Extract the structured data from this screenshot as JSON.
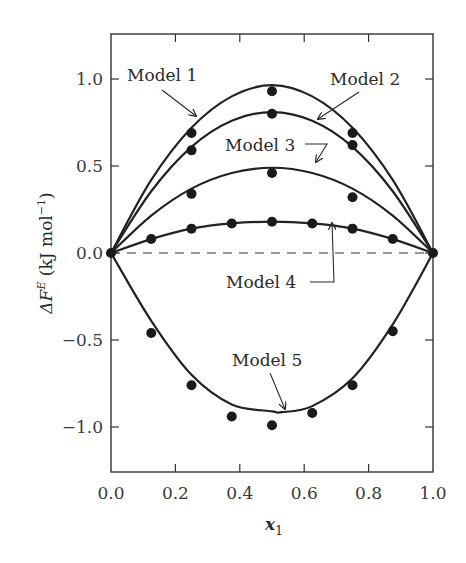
{
  "chart_data": {
    "type": "line",
    "title": "",
    "xlabel": "x1",
    "ylabel": "ΔF^E (kJ mol^-1)",
    "xlim": [
      0.0,
      1.0
    ],
    "ylim": [
      -1.26,
      1.26
    ],
    "grid": false,
    "legend": "inline annotations with arrows",
    "x_ticks": [
      "0.0",
      "0.2",
      "0.4",
      "0.6",
      "0.8",
      "1.0"
    ],
    "y_ticks": [
      "1.0",
      "0.5",
      "0.0",
      "-0.5",
      "-1.0"
    ],
    "reference_line": {
      "y": 0.0,
      "style": "dashed"
    },
    "series": [
      {
        "name": "Model 1",
        "curve_peak": 0.965,
        "curve_x": [
          0,
          0.125,
          0.25,
          0.375,
          0.5,
          0.625,
          0.75,
          0.875,
          1.0
        ],
        "curve_y": [
          0,
          0.42,
          0.72,
          0.9,
          0.965,
          0.9,
          0.72,
          0.42,
          0
        ],
        "points_x": [
          0.0,
          0.25,
          0.5,
          0.75,
          1.0
        ],
        "points_y": [
          0.0,
          0.69,
          0.93,
          0.69,
          0.0
        ]
      },
      {
        "name": "Model 2",
        "curve_peak": 0.81,
        "curve_x": [
          0,
          0.125,
          0.25,
          0.375,
          0.5,
          0.625,
          0.75,
          0.875,
          1.0
        ],
        "curve_y": [
          0,
          0.355,
          0.61,
          0.76,
          0.81,
          0.76,
          0.61,
          0.355,
          0
        ],
        "points_x": [
          0.25,
          0.5,
          0.75
        ],
        "points_y": [
          0.59,
          0.8,
          0.62
        ]
      },
      {
        "name": "Model 3",
        "curve_peak": 0.49,
        "curve_x": [
          0,
          0.125,
          0.25,
          0.375,
          0.5,
          0.625,
          0.75,
          0.875,
          1.0
        ],
        "curve_y": [
          0,
          0.215,
          0.37,
          0.46,
          0.49,
          0.46,
          0.37,
          0.215,
          0
        ],
        "points_x": [
          0.25,
          0.5,
          0.75
        ],
        "points_y": [
          0.34,
          0.46,
          0.32
        ]
      },
      {
        "name": "Model 4",
        "curve_peak": 0.18,
        "curve_x": [
          0,
          0.125,
          0.25,
          0.375,
          0.5,
          0.625,
          0.75,
          0.875,
          1.0
        ],
        "curve_y": [
          0,
          0.08,
          0.14,
          0.17,
          0.18,
          0.17,
          0.14,
          0.08,
          0
        ],
        "points_x": [
          0.125,
          0.25,
          0.375,
          0.5,
          0.625,
          0.75,
          0.875
        ],
        "points_y": [
          0.08,
          0.14,
          0.17,
          0.18,
          0.17,
          0.14,
          0.08
        ]
      },
      {
        "name": "Model 5",
        "curve_peak": -0.915,
        "curve_x": [
          0,
          0.125,
          0.25,
          0.375,
          0.5,
          0.53,
          0.625,
          0.75,
          0.875,
          1.0
        ],
        "curve_y": [
          0,
          -0.39,
          -0.7,
          -0.87,
          -0.91,
          -0.915,
          -0.88,
          -0.72,
          -0.41,
          0
        ],
        "points_x": [
          0.125,
          0.25,
          0.375,
          0.5,
          0.625,
          0.75,
          0.875
        ],
        "points_y": [
          -0.46,
          -0.76,
          -0.94,
          -0.99,
          -0.92,
          -0.76,
          -0.45
        ]
      }
    ]
  },
  "labels": {
    "model1": "Model 1",
    "model2": "Model 2",
    "model3": "Model 3",
    "model4": "Model 4",
    "model5": "Model 5",
    "y_title_main": "ΔF",
    "y_title_sup": "E",
    "y_title_unit_open": " (kJ mol",
    "y_title_unit_sup": "−1",
    "y_title_close": ")",
    "x_title_main": "x",
    "x_title_sub": "1"
  },
  "colors": {
    "ink": "#2a2a2a",
    "background": "#ffffff"
  }
}
